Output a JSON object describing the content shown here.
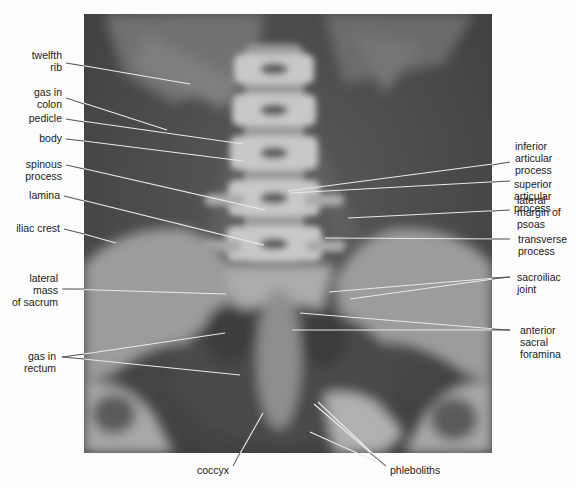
{
  "figure": {
    "type": "annotated radiograph"
  },
  "labels_left": [
    {
      "id": "twelfth-rib",
      "lines": [
        "twelfth",
        "rib"
      ]
    },
    {
      "id": "gas-in-colon",
      "lines": [
        "gas in",
        "colon"
      ]
    },
    {
      "id": "pedicle",
      "lines": [
        "pedicle"
      ]
    },
    {
      "id": "body",
      "lines": [
        "body"
      ]
    },
    {
      "id": "spinous-process",
      "lines": [
        "spinous",
        "process"
      ]
    },
    {
      "id": "lamina",
      "lines": [
        "lamina"
      ]
    },
    {
      "id": "iliac-crest",
      "lines": [
        "iliac crest"
      ]
    },
    {
      "id": "lateral-mass-of-sacrum",
      "lines": [
        "lateral",
        "mass",
        "of sacrum"
      ]
    },
    {
      "id": "gas-in-rectum",
      "lines": [
        "gas in",
        "rectum"
      ]
    }
  ],
  "labels_right": [
    {
      "id": "inferior-articular-process",
      "lines": [
        "inferior",
        "articular",
        "process"
      ]
    },
    {
      "id": "superior-articular-process",
      "lines": [
        "superior",
        "articular",
        "process"
      ]
    },
    {
      "id": "lateral-margin-of-psoas",
      "lines": [
        "lateral",
        "margin of",
        "psoas"
      ]
    },
    {
      "id": "transverse-process",
      "lines": [
        "transverse",
        "process"
      ]
    },
    {
      "id": "sacroiliac-joint",
      "lines": [
        "sacroiliac",
        "joint"
      ]
    },
    {
      "id": "anterior-sacral-foramina",
      "lines": [
        "anterior",
        "sacral",
        "foramina"
      ]
    }
  ],
  "labels_bottom": [
    {
      "id": "coccyx",
      "lines": [
        "coccyx"
      ]
    },
    {
      "id": "phleboliths",
      "lines": [
        "phleboliths"
      ]
    }
  ]
}
